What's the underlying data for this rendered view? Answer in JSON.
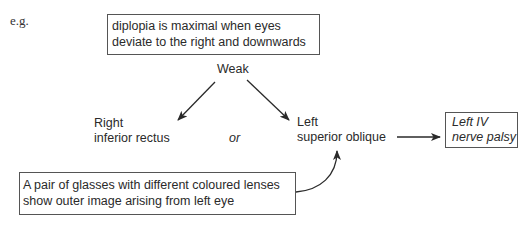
{
  "label_eg": "e.g.",
  "top_box": {
    "line1": "diplopia is maximal when eyes",
    "line2": "deviate to the right and downwards"
  },
  "weak_label": "Weak",
  "option_right": {
    "line1": "Right",
    "line2": "inferior rectus"
  },
  "or_label": "or",
  "option_left": {
    "line1": "Left",
    "line2": "superior oblique"
  },
  "result_box": {
    "line1": "Left IV",
    "line2": "nerve palsy"
  },
  "bottom_box": {
    "line1": "A pair of glasses with different coloured lenses",
    "line2": "show outer image arising from left eye"
  },
  "colors": {
    "line": "#2a2a2a",
    "border": "#555555",
    "text": "#2a2a2a"
  }
}
